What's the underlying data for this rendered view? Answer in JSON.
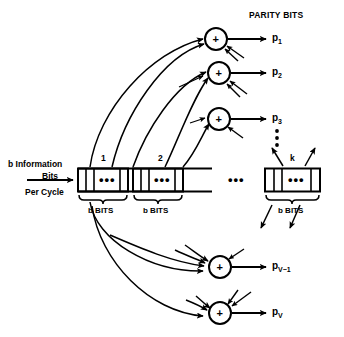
{
  "diagram": {
    "title": "PARITY BITS",
    "input_label": {
      "line1": "b Information",
      "line2": "Bits",
      "line3": "Per Cycle"
    },
    "register": {
      "block_numbers": [
        "1",
        "2",
        "k"
      ],
      "group_label": "b BITS",
      "cell_ellipsis": "•••",
      "block_gap_ellipsis": "•••",
      "blocks": [
        {
          "number": "1",
          "bits_label": "b BITS",
          "ellipsis": "•••"
        },
        {
          "number": "2",
          "bits_label": "b BITS",
          "ellipsis": "•••"
        },
        {
          "number": "k",
          "bits_label": "b BITS",
          "ellipsis": "•••"
        }
      ]
    },
    "adders": [
      {
        "id": "adder-1",
        "symbol": "+",
        "output": "p",
        "subscript": "1"
      },
      {
        "id": "adder-2",
        "symbol": "+",
        "output": "p",
        "subscript": "2"
      },
      {
        "id": "adder-3",
        "symbol": "+",
        "output": "p",
        "subscript": "3"
      },
      {
        "id": "adder-v-minus-1",
        "symbol": "+",
        "output": "p",
        "subscript": "V−1"
      },
      {
        "id": "adder-v",
        "symbol": "+",
        "output": "p",
        "subscript": "V"
      }
    ],
    "outputs": [
      {
        "base": "p",
        "sub": "1"
      },
      {
        "base": "p",
        "sub": "2"
      },
      {
        "base": "p",
        "sub": "3"
      },
      {
        "base": "p",
        "sub": "V−1"
      },
      {
        "base": "p",
        "sub": "V"
      }
    ],
    "vertical_ellipsis": "⋮",
    "colors": {
      "stroke": "#000000",
      "background": "#ffffff"
    }
  }
}
